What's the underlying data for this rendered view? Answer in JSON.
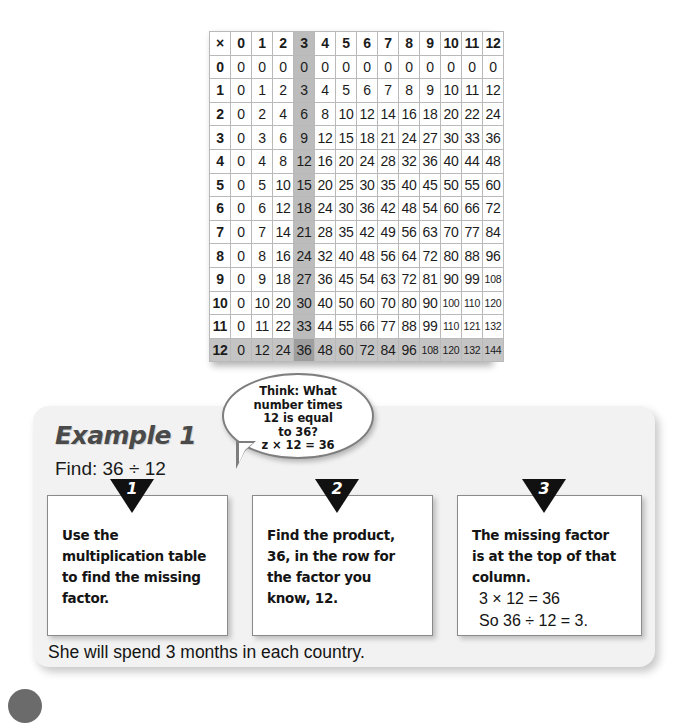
{
  "multiplication_table": {
    "corner_symbol": "×",
    "column_headers": [
      "0",
      "1",
      "2",
      "3",
      "4",
      "5",
      "6",
      "7",
      "8",
      "9",
      "10",
      "11",
      "12"
    ],
    "row_headers": [
      "0",
      "1",
      "2",
      "3",
      "4",
      "5",
      "6",
      "7",
      "8",
      "9",
      "10",
      "11",
      "12"
    ],
    "highlighted_column_index": 3,
    "highlighted_row_index": 12,
    "highlight_colors": {
      "column": "#bcbcbc",
      "row": "#c4c4c4",
      "intersection": "#9e9e9e"
    },
    "rows": [
      [
        "0",
        "0",
        "0",
        "0",
        "0",
        "0",
        "0",
        "0",
        "0",
        "0",
        "0",
        "0",
        "0"
      ],
      [
        "0",
        "1",
        "2",
        "3",
        "4",
        "5",
        "6",
        "7",
        "8",
        "9",
        "10",
        "11",
        "12"
      ],
      [
        "0",
        "2",
        "4",
        "6",
        "8",
        "10",
        "12",
        "14",
        "16",
        "18",
        "20",
        "22",
        "24"
      ],
      [
        "0",
        "3",
        "6",
        "9",
        "12",
        "15",
        "18",
        "21",
        "24",
        "27",
        "30",
        "33",
        "36"
      ],
      [
        "0",
        "4",
        "8",
        "12",
        "16",
        "20",
        "24",
        "28",
        "32",
        "36",
        "40",
        "44",
        "48"
      ],
      [
        "0",
        "5",
        "10",
        "15",
        "20",
        "25",
        "30",
        "35",
        "40",
        "45",
        "50",
        "55",
        "60"
      ],
      [
        "0",
        "6",
        "12",
        "18",
        "24",
        "30",
        "36",
        "42",
        "48",
        "54",
        "60",
        "66",
        "72"
      ],
      [
        "0",
        "7",
        "14",
        "21",
        "28",
        "35",
        "42",
        "49",
        "56",
        "63",
        "70",
        "77",
        "84"
      ],
      [
        "0",
        "8",
        "16",
        "24",
        "32",
        "40",
        "48",
        "56",
        "64",
        "72",
        "80",
        "88",
        "96"
      ],
      [
        "0",
        "9",
        "18",
        "27",
        "36",
        "45",
        "54",
        "63",
        "72",
        "81",
        "90",
        "99",
        "108"
      ],
      [
        "0",
        "10",
        "20",
        "30",
        "40",
        "50",
        "60",
        "70",
        "80",
        "90",
        "100",
        "110",
        "120"
      ],
      [
        "0",
        "11",
        "22",
        "33",
        "44",
        "55",
        "66",
        "77",
        "88",
        "99",
        "110",
        "121",
        "132"
      ],
      [
        "0",
        "12",
        "24",
        "36",
        "48",
        "60",
        "72",
        "84",
        "96",
        "108",
        "120",
        "132",
        "144"
      ]
    ]
  },
  "example": {
    "heading": "Example 1",
    "find_label": "Find: 36 ÷ 12",
    "thought_bubble": {
      "lines": [
        "Think:  What",
        "number times",
        "12 is equal",
        "to 36?",
        "z × 12 = 36"
      ]
    },
    "steps": [
      {
        "number": "1",
        "lines": [
          "Use the",
          "multiplication table",
          "to find the missing",
          "factor."
        ],
        "equations": []
      },
      {
        "number": "2",
        "lines": [
          "Find the product,",
          "36, in the row for",
          "the factor you",
          "know, 12."
        ],
        "equations": []
      },
      {
        "number": "3",
        "lines": [
          "The missing factor",
          "is at the top of that",
          "column."
        ],
        "equations": [
          "3 × 12 = 36",
          "So 36 ÷ 12 = 3."
        ]
      }
    ],
    "bottom_sentence": "She will spend 3 months in each country."
  }
}
